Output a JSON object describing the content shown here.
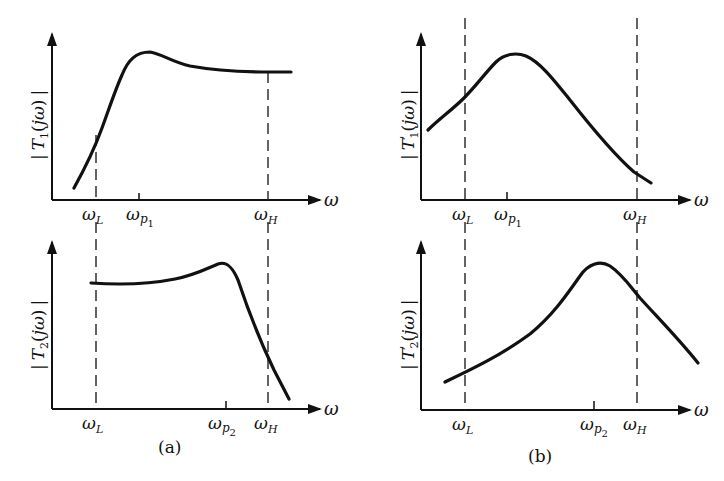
{
  "figure": {
    "captions": {
      "a": "(a)",
      "b": "(b)"
    },
    "axis_symbol": "ω",
    "panels": [
      {
        "id": "a-top",
        "ylabel": "|T₁(jω)|",
        "ylabel_main": "T",
        "ylabel_sub": "1",
        "ylabel_prime": "",
        "xlabels": {
          "wL": "ω",
          "wL_sub": "L",
          "wp": "ω",
          "wp_sub": "p",
          "wp_subsub": "1",
          "wH": "ω",
          "wH_sub": "H"
        }
      },
      {
        "id": "a-bottom",
        "ylabel": "|T₂(jω)|",
        "ylabel_main": "T",
        "ylabel_sub": "2",
        "ylabel_prime": "",
        "xlabels": {
          "wL": "ω",
          "wL_sub": "L",
          "wp": "ω",
          "wp_sub": "p",
          "wp_subsub": "2",
          "wH": "ω",
          "wH_sub": "H"
        }
      },
      {
        "id": "b-top",
        "ylabel": "|T'₁(jω)|",
        "ylabel_main": "T",
        "ylabel_sub": "1",
        "ylabel_prime": "'",
        "xlabels": {
          "wL": "ω",
          "wL_sub": "L",
          "wp": "ω",
          "wp_sub": "p",
          "wp_subsub": "1",
          "wH": "ω",
          "wH_sub": "H"
        }
      },
      {
        "id": "b-bottom",
        "ylabel": "|T'₂(jω)|",
        "ylabel_main": "T",
        "ylabel_sub": "2",
        "ylabel_prime": "'",
        "xlabels": {
          "wL": "ω",
          "wL_sub": "L",
          "wp": "ω",
          "wp_sub": "p",
          "wp_subsub": "2",
          "wH": "ω",
          "wH_sub": "H"
        }
      }
    ],
    "ylabel_parts": {
      "open": "|",
      "paren_open": "(",
      "j": "j",
      "omega": "ω",
      "paren_close": ")",
      "close": "|"
    }
  }
}
